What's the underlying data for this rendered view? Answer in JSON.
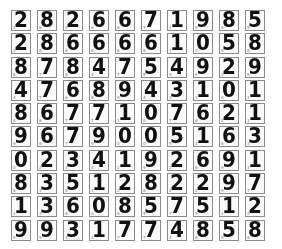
{
  "figure": {
    "rows": 10,
    "cols": 10,
    "label_color": "#3a9a3a",
    "border_color": "#8a8a8a"
  },
  "digits": [
    [
      2,
      8,
      2,
      6,
      6,
      7,
      1,
      9,
      8,
      5
    ],
    [
      2,
      8,
      6,
      6,
      6,
      6,
      1,
      0,
      5,
      8
    ],
    [
      8,
      7,
      8,
      4,
      7,
      5,
      4,
      9,
      2,
      9
    ],
    [
      4,
      7,
      6,
      8,
      9,
      4,
      3,
      1,
      0,
      1
    ],
    [
      8,
      6,
      7,
      7,
      1,
      0,
      7,
      6,
      2,
      1
    ],
    [
      9,
      6,
      7,
      9,
      0,
      0,
      5,
      1,
      6,
      3
    ],
    [
      0,
      2,
      3,
      4,
      1,
      9,
      2,
      6,
      9,
      1
    ],
    [
      8,
      3,
      5,
      1,
      2,
      8,
      2,
      2,
      9,
      7
    ],
    [
      1,
      3,
      6,
      0,
      8,
      5,
      7,
      5,
      1,
      2
    ],
    [
      9,
      9,
      3,
      1,
      7,
      7,
      4,
      8,
      5,
      8
    ]
  ]
}
